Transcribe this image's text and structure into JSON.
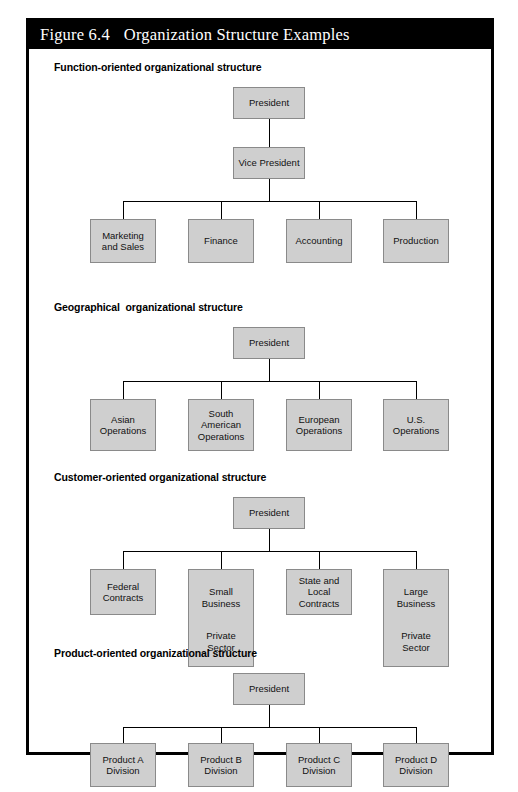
{
  "figure": {
    "label": "Figure 6.4",
    "title": "Organization Structure Examples",
    "titlebar_bg": "#000000",
    "titlebar_fg": "#ffffff",
    "frame_border": "#000000",
    "node_fill": "#cfcfcf",
    "node_border": "#8a8a8a",
    "line_color": "#000000"
  },
  "sections": [
    {
      "id": "function-oriented",
      "title": "Function-oriented organizational structure",
      "levels": [
        {
          "nodes": [
            "President"
          ]
        },
        {
          "nodes": [
            "Vice President"
          ]
        },
        {
          "nodes": [
            "Marketing\nand Sales",
            "Finance",
            "Accounting",
            "Production"
          ]
        }
      ]
    },
    {
      "id": "geographical",
      "title": "Geographical  organizational structure",
      "levels": [
        {
          "nodes": [
            "President"
          ]
        },
        {
          "nodes": [
            "Asian\nOperations",
            "South\nAmerican\nOperations",
            "European\nOperations",
            "U.S.\nOperations"
          ]
        }
      ]
    },
    {
      "id": "customer-oriented",
      "title": "Customer-oriented organizational structure",
      "levels": [
        {
          "nodes": [
            "President"
          ]
        },
        {
          "nodes": [
            "Federal\nContracts",
            "Small\nBusiness",
            "State and\nLocal Contracts",
            "Large\nBusiness"
          ]
        }
      ],
      "subnotes": [
        "",
        "Private\nSector",
        "",
        "Private\nSector"
      ]
    },
    {
      "id": "product-oriented",
      "title": "Product-oriented organizational structure",
      "levels": [
        {
          "nodes": [
            "President"
          ]
        },
        {
          "nodes": [
            "Product A\nDivision",
            "Product B\nDivision",
            "Product C\nDivision",
            "Product D\nDivision"
          ]
        }
      ]
    }
  ]
}
